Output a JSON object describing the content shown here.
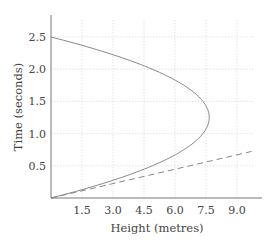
{
  "chart_data": {
    "type": "line",
    "title": "",
    "xlabel": "Height (metres)",
    "ylabel": "Time (seconds)",
    "xlim": [
      0,
      10.2
    ],
    "ylim": [
      0,
      2.8
    ],
    "x_ticks": [
      1.5,
      3.0,
      4.5,
      6.0,
      7.5,
      9.0
    ],
    "x_tick_labels": [
      "1.5",
      "3.0",
      "4.5",
      "6.0",
      "7.5",
      "9.0"
    ],
    "y_ticks": [
      0.5,
      1.0,
      1.5,
      2.0,
      2.5
    ],
    "y_tick_labels": [
      "0.5",
      "1.0",
      "1.5",
      "2.0",
      "2.5"
    ],
    "grid": true,
    "grid_style": "dotted",
    "legend": null,
    "series": [
      {
        "name": "Projectile height vs time",
        "style": "solid",
        "color": "#888888",
        "formula": "h = 12.25 t - 4.9 t^2",
        "points": [
          {
            "t": 0.0,
            "h": 0.0
          },
          {
            "t": 0.25,
            "h": 2.76
          },
          {
            "t": 0.5,
            "h": 4.9
          },
          {
            "t": 0.75,
            "h": 6.43
          },
          {
            "t": 1.0,
            "h": 7.35
          },
          {
            "t": 1.25,
            "h": 7.66
          },
          {
            "t": 1.5,
            "h": 7.35
          },
          {
            "t": 1.75,
            "h": 6.43
          },
          {
            "t": 2.0,
            "h": 4.9
          },
          {
            "t": 2.25,
            "h": 2.76
          },
          {
            "t": 2.5,
            "h": 0.0
          }
        ]
      },
      {
        "name": "Tangent / reference line",
        "style": "dashed",
        "color": "#888888",
        "points": [
          {
            "t": 0.0,
            "h": 0.0
          },
          {
            "t": 0.73,
            "h": 9.8
          }
        ]
      }
    ]
  }
}
